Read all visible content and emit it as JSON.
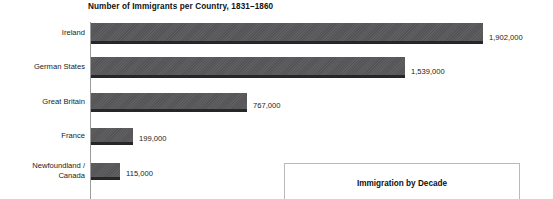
{
  "chart_data": {
    "type": "bar",
    "orientation": "horizontal",
    "title": "Number of Immigrants per Country, 1831–1860",
    "xlabel": "",
    "ylabel": "",
    "grid": false,
    "legend": "none",
    "xlim": [
      0,
      1902000
    ],
    "categories": [
      "Ireland",
      "German States",
      "Great Britain",
      "France",
      "Newfoundland /\nCanada"
    ],
    "values": [
      1902000,
      1539000,
      767000,
      199000,
      115000
    ],
    "value_labels": [
      "1,902,000",
      "1,539,000",
      "767,000",
      "199,000",
      "115,000"
    ],
    "bar_color": "#58585a",
    "bar_shadow_color": "#262628",
    "axis_color": "#9a9a9a"
  },
  "inset_panel": {
    "title": "Immigration by Decade",
    "border_color": "#b9b9b9"
  },
  "bars": [
    {
      "label": "Ireland",
      "value_label": "1,902,000",
      "top": 23,
      "height": 21,
      "width": 392
    },
    {
      "label": "German States",
      "value_label": "1,539,000",
      "top": 57,
      "height": 21,
      "width": 314
    },
    {
      "label": "Great Britain",
      "value_label": "767,000",
      "top": 93,
      "height": 19,
      "width": 156
    },
    {
      "label": "France",
      "value_label": "199,000",
      "top": 128,
      "height": 17,
      "width": 42
    },
    {
      "label": "Newfoundland /\nCanada",
      "value_label": "115,000",
      "top": 163,
      "height": 17,
      "width": 29
    }
  ]
}
